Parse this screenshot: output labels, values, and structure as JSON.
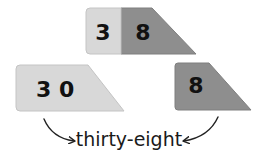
{
  "colors": {
    "tens_card": "#d8d8d8",
    "ones_card": "#8e8e8e",
    "card_edge": "#bdbdbd",
    "arrow": "#222222",
    "text": "#1a1a1a"
  },
  "combined_card": {
    "tens_digit": "3",
    "ones_digit": "8"
  },
  "tens_card": {
    "label": "3 0",
    "tens_digit": "3",
    "ones_digit": "0"
  },
  "ones_card": {
    "digit": "8"
  },
  "caption": {
    "text": "thirty-eight"
  },
  "arrows": [
    {
      "from": "tens_card",
      "to": "caption"
    },
    {
      "from": "ones_card",
      "to": "caption"
    }
  ]
}
